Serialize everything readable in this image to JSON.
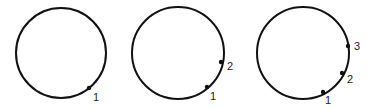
{
  "diagram": {
    "stroke_color": "#111111",
    "panels": [
      {
        "circle": {
          "cx": 61,
          "cy": 53,
          "r": 45
        },
        "points": [
          {
            "label": "1",
            "x": 89,
            "y": 88,
            "lx": 93,
            "ly": 101
          }
        ]
      },
      {
        "circle": {
          "cx": 178,
          "cy": 53,
          "r": 46
        },
        "points": [
          {
            "label": "1",
            "x": 207,
            "y": 87,
            "lx": 210,
            "ly": 100
          },
          {
            "label": "2",
            "x": 221,
            "y": 62,
            "lx": 227,
            "ly": 70
          }
        ]
      },
      {
        "circle": {
          "cx": 303,
          "cy": 53,
          "r": 46
        },
        "points": [
          {
            "label": "1",
            "x": 323,
            "y": 92,
            "lx": 325,
            "ly": 104
          },
          {
            "label": "2",
            "x": 342,
            "y": 73,
            "lx": 347,
            "ly": 83
          },
          {
            "label": "3",
            "x": 348,
            "y": 46,
            "lx": 354,
            "ly": 50
          }
        ]
      }
    ]
  }
}
